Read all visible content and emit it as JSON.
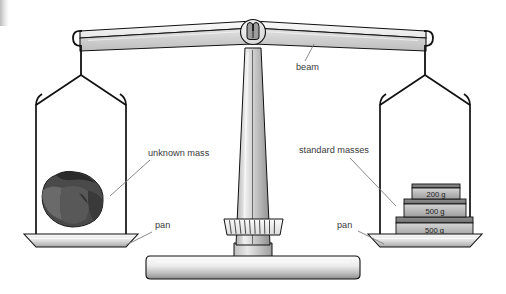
{
  "diagram": {
    "background_color": "#ffffff",
    "ink_color": "#111111",
    "label_color": "#3a3a3a",
    "leader_color": "#7d7d7d"
  },
  "labels": {
    "beam": "beam",
    "unknown_mass": "unknown mass",
    "standard_masses": "standard masses",
    "pan_left": "pan",
    "pan_right": "pan"
  },
  "weights": [
    {
      "label": "200 g",
      "value": 200,
      "unit": "g",
      "position": "top"
    },
    {
      "label": "500 g",
      "value": 500,
      "unit": "g",
      "position": "middle"
    },
    {
      "label": "500 g",
      "value": 500,
      "unit": "g",
      "position": "bottom"
    }
  ],
  "parts": {
    "beam_label": "beam",
    "pivot": "pivot-housing",
    "indicator": "graduated-indicator",
    "base": "stand-base",
    "column": "center-column",
    "hanger_left": "stirrup-left",
    "hanger_right": "stirrup-right",
    "specimen": "rock-specimen"
  },
  "colors": {
    "metal_light": "#f2f2f2",
    "metal_mid": "#c9c9c9",
    "metal_dark": "#9a9a9a",
    "rock_dark": "#3d3d3d",
    "rock_mid": "#5d5d5d",
    "rock_light": "#6f6f6f",
    "weight_face": "#b4b4b4"
  }
}
